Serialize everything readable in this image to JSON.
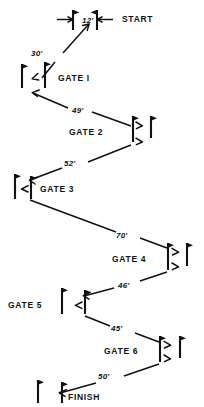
{
  "diagram": {
    "type": "zigzag-gate-course",
    "ink_color": "#111111",
    "background_color": "#ffffff",
    "markers": [
      {
        "id": "start",
        "label": "START",
        "x": 122,
        "y": 18
      },
      {
        "id": "gate1",
        "label": "GATE  I",
        "x": 58,
        "y": 78
      },
      {
        "id": "gate2",
        "label": "GATE  2",
        "x": 69,
        "y": 132
      },
      {
        "id": "gate3",
        "label": "GATE  3",
        "x": 40,
        "y": 189
      },
      {
        "id": "gate4",
        "label": "GATE  4",
        "x": 112,
        "y": 259
      },
      {
        "id": "gate5",
        "label": "GATE  5",
        "x": 8,
        "y": 303
      },
      {
        "id": "gate6",
        "label": "GATE  6",
        "x": 104,
        "y": 351
      },
      {
        "id": "finish",
        "label": "FINISH",
        "x": 68,
        "y": 397
      }
    ],
    "distances": [
      {
        "id": "d-start",
        "label": "12'",
        "x": 82,
        "y": 21
      },
      {
        "id": "d-1",
        "label": "30'",
        "x": 40,
        "y": 53
      },
      {
        "id": "d-2",
        "label": "49'",
        "x": 78,
        "y": 110
      },
      {
        "id": "d-3",
        "label": "52'",
        "x": 70,
        "y": 163
      },
      {
        "id": "d-4",
        "label": "70'",
        "x": 122,
        "y": 234
      },
      {
        "id": "d-5",
        "label": "46'",
        "x": 124,
        "y": 285
      },
      {
        "id": "d-6",
        "label": "45'",
        "x": 117,
        "y": 329
      },
      {
        "id": "d-7",
        "label": "50'",
        "x": 101,
        "y": 375
      }
    ],
    "gate_flags": [
      {
        "gate": "start",
        "poles_x": [
          73,
          97
        ],
        "top_y": 10,
        "bottom_y": 30
      },
      {
        "gate": "gate1",
        "poles_x": [
          22,
          45
        ],
        "top_y": 62,
        "bottom_y": 88
      },
      {
        "gate": "gate2",
        "poles_x": [
          133,
          151
        ],
        "top_y": 116,
        "bottom_y": 142
      },
      {
        "gate": "gate3",
        "poles_x": [
          15,
          31
        ],
        "top_y": 174,
        "bottom_y": 199
      },
      {
        "gate": "gate4",
        "poles_x": [
          168,
          187
        ],
        "top_y": 243,
        "bottom_y": 270
      },
      {
        "gate": "gate5",
        "poles_x": [
          62,
          85
        ],
        "top_y": 288,
        "bottom_y": 314
      },
      {
        "gate": "gate6",
        "poles_x": [
          160,
          180
        ],
        "top_y": 336,
        "bottom_y": 362
      },
      {
        "gate": "finish",
        "poles_x": [
          38,
          62
        ],
        "top_y": 380,
        "bottom_y": 403
      }
    ],
    "legs": [
      {
        "id": "leg-30",
        "from": "gate1",
        "to": "start",
        "label": "30'"
      },
      {
        "id": "leg-49",
        "from": "gate2",
        "to": "gate1",
        "label": "49'"
      },
      {
        "id": "leg-52",
        "from": "gate2",
        "to": "gate3",
        "label": "52'"
      },
      {
        "id": "leg-70",
        "from": "gate3",
        "to": "gate4",
        "label": "70'"
      },
      {
        "id": "leg-46",
        "from": "gate4",
        "to": "gate5",
        "label": "46'"
      },
      {
        "id": "leg-45",
        "from": "gate5",
        "to": "gate6",
        "label": "45'"
      },
      {
        "id": "leg-50",
        "from": "gate6",
        "to": "finish",
        "label": "50'"
      }
    ]
  }
}
